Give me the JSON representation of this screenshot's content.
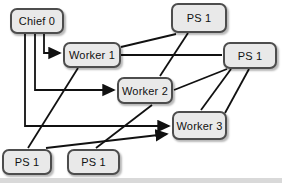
{
  "diagram": {
    "colors": {
      "background": "#ffffff",
      "node_fill": "#e9e9e9",
      "node_border": "#4d4d4d",
      "line": "#111111",
      "bottom_strip": "#d9d9d9"
    },
    "nodes": [
      {
        "id": "chief-0",
        "label": "Chief 0",
        "x": 10,
        "y": 8,
        "w": 54,
        "h": 26
      },
      {
        "id": "worker-1",
        "label": "Worker 1",
        "x": 63,
        "y": 42,
        "w": 58,
        "h": 26
      },
      {
        "id": "worker-2",
        "label": "Worker 2",
        "x": 117,
        "y": 77,
        "w": 56,
        "h": 27
      },
      {
        "id": "worker-3",
        "label": "Worker 3",
        "x": 172,
        "y": 111,
        "w": 55,
        "h": 29
      },
      {
        "id": "ps-top",
        "label": "PS 1",
        "x": 171,
        "y": 3,
        "w": 56,
        "h": 30
      },
      {
        "id": "ps-right",
        "label": "PS 1",
        "x": 223,
        "y": 42,
        "w": 54,
        "h": 27
      },
      {
        "id": "ps-bottom-left",
        "label": "PS 1",
        "x": 2,
        "y": 149,
        "w": 50,
        "h": 26
      },
      {
        "id": "ps-bottom-mid",
        "label": "PS 1",
        "x": 67,
        "y": 149,
        "w": 53,
        "h": 26
      }
    ],
    "edges": [
      {
        "name": "chief-0-to-worker-1",
        "points": [
          [
            44,
            34
          ],
          [
            44,
            53
          ],
          [
            60,
            53
          ]
        ],
        "arrow": true
      },
      {
        "name": "chief-0-to-worker-2",
        "points": [
          [
            35,
            34
          ],
          [
            35,
            90
          ],
          [
            114,
            90
          ]
        ],
        "arrow": true
      },
      {
        "name": "chief-0-to-worker-3",
        "points": [
          [
            25,
            34
          ],
          [
            25,
            126
          ],
          [
            169,
            126
          ]
        ],
        "arrow": true
      },
      {
        "name": "worker-1-to-ps-top",
        "points": [
          [
            121,
            47
          ],
          [
            176,
            34
          ]
        ],
        "arrow": false
      },
      {
        "name": "worker-1-to-ps-right",
        "points": [
          [
            121,
            55
          ],
          [
            222,
            55
          ]
        ],
        "arrow": false
      },
      {
        "name": "worker-1-to-ps-bottom-left",
        "points": [
          [
            78,
            68
          ],
          [
            28,
            148
          ]
        ],
        "arrow": false
      },
      {
        "name": "ps-top-to-worker-2",
        "points": [
          [
            188,
            33
          ],
          [
            160,
            76
          ]
        ],
        "arrow": false
      },
      {
        "name": "ps-right-to-worker-2",
        "points": [
          [
            227,
            69
          ],
          [
            174,
            90
          ]
        ],
        "arrow": false
      },
      {
        "name": "ps-right-to-worker-3-a",
        "points": [
          [
            231,
            69
          ],
          [
            201,
            110
          ]
        ],
        "arrow": false
      },
      {
        "name": "ps-right-to-worker-3-b",
        "points": [
          [
            249,
            69
          ],
          [
            225,
            113
          ]
        ],
        "arrow": false
      },
      {
        "name": "ps-bottom-left-to-worker-3",
        "points": [
          [
            46,
            148
          ],
          [
            167,
            134
          ]
        ],
        "arrow": true
      },
      {
        "name": "ps-bottom-mid-to-worker-2",
        "points": [
          [
            96,
            148
          ],
          [
            152,
            105
          ]
        ],
        "arrow": false
      }
    ]
  }
}
